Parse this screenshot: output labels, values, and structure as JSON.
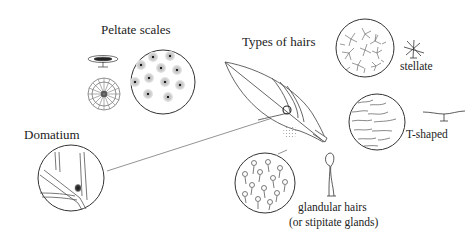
{
  "diagram": {
    "labels": {
      "peltate_scales": "Peltate scales",
      "types_of_hairs": "Types of hairs",
      "domatium": "Domatium",
      "stellate": "stellate",
      "t_shaped": "T-shaped",
      "glandular_line1": "glandular hairs",
      "glandular_line2": "(or stipitate glands)"
    },
    "colors": {
      "line": "#444444",
      "text": "#222222",
      "background": "#ffffff",
      "scale_fill": "#cfcfcf"
    }
  }
}
